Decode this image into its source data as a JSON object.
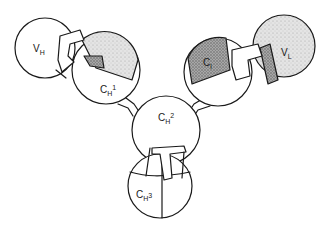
{
  "figure": {
    "domains": [
      {
        "id": "vh",
        "label_main": "V",
        "label_sub": "H",
        "label_sup": "",
        "shading": "none"
      },
      {
        "id": "ch1",
        "label_main": "C",
        "label_sub": "H",
        "label_sup": "1",
        "shading": "partial-light"
      },
      {
        "id": "cl",
        "label_main": "C",
        "label_sub": "l",
        "label_sup": "",
        "shading": "dark"
      },
      {
        "id": "vl",
        "label_main": "V",
        "label_sub": "L",
        "label_sup": "",
        "shading": "light"
      },
      {
        "id": "ch2",
        "label_main": "C",
        "label_sub": "H",
        "label_sup": "2",
        "shading": "none"
      },
      {
        "id": "ch3",
        "label_main": "C",
        "label_sub": "H",
        "label_sup": "3",
        "shading": "none"
      }
    ],
    "colors": {
      "ink": "#1a1a1a",
      "background": "#ffffff",
      "stipple_light": "#d6d6d6",
      "stipple_dark": "#8a8a8a"
    }
  }
}
